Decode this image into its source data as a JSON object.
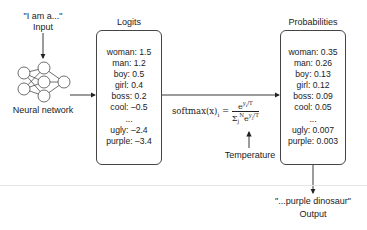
{
  "input": {
    "quote": "\"I am a...\"",
    "label": "Input"
  },
  "network": {
    "label": "Neural network"
  },
  "logits": {
    "title": "Logits",
    "items": [
      "woman: 1.5",
      "man: 1.2",
      "boy: 0.5",
      "girl: 0.4",
      "boss: 0.2",
      "cool: –0.5",
      "...",
      "ugly: –2.4",
      "purple: –3.4"
    ]
  },
  "softmax": {
    "lhs": "softmax(x)",
    "lhs_sub": "i",
    "eq": "=",
    "numerator": "e^(y_i / T)",
    "denominator": "Σ_j^N e^(y_j / T)",
    "temperature_label": "Temperature"
  },
  "probabilities": {
    "title": "Probabilities",
    "items": [
      "woman: 0.35",
      "man: 0.26",
      "boy: 0.13",
      "girl: 0.12",
      "boss: 0.09",
      "cool: 0.05",
      "...",
      "ugly: 0.007",
      "purple: 0.003"
    ]
  },
  "output": {
    "quote": "\"...purple dinosaur\"",
    "label": "Output"
  }
}
